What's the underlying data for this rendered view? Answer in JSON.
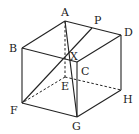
{
  "diagram": {
    "type": "cube",
    "labels": {
      "A": "A",
      "B": "B",
      "C": "C",
      "D": "D",
      "E": "E",
      "F": "F",
      "G": "G",
      "H": "H",
      "P": "P",
      "X": "X"
    },
    "vertices": {
      "A": [
        65,
        21
      ],
      "B": [
        22,
        48
      ],
      "C": [
        77,
        62
      ],
      "D": [
        121,
        35
      ],
      "E": [
        65,
        77
      ],
      "F": [
        22,
        103
      ],
      "G": [
        77,
        117
      ],
      "H": [
        121,
        90
      ],
      "P": [
        92,
        28
      ],
      "X": [
        63,
        58
      ]
    },
    "visible_edges": [
      [
        "A",
        "B"
      ],
      [
        "A",
        "D"
      ],
      [
        "B",
        "C"
      ],
      [
        "C",
        "D"
      ],
      [
        "B",
        "F"
      ],
      [
        "C",
        "G"
      ],
      [
        "D",
        "H"
      ],
      [
        "F",
        "G"
      ],
      [
        "G",
        "H"
      ]
    ],
    "hidden_edges": [
      [
        "A",
        "E"
      ],
      [
        "E",
        "F"
      ],
      [
        "E",
        "H"
      ]
    ],
    "extra_segments": [
      [
        "F",
        "P"
      ],
      [
        "A",
        "G"
      ]
    ],
    "colors": {
      "stroke": "#222222",
      "background": "#ffffff"
    }
  }
}
